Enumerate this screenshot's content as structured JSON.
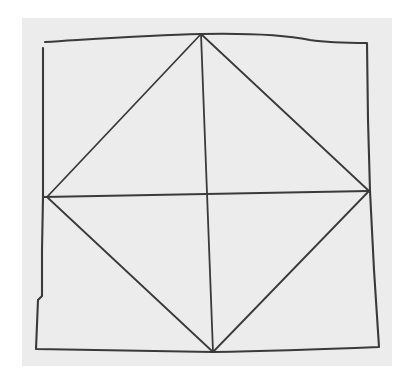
{
  "figure": {
    "colors": {
      "page": "#ffffff",
      "paper": "#ececec",
      "ink": "#3a3a3a"
    },
    "paper_rect": {
      "x": 22,
      "y": 18,
      "w": 370,
      "h": 348
    },
    "outer_square": {
      "path": "M45,42 C110,38 150,35 201,34 C250,33 290,36 310,40 C330,43 350,43 367,43 L368,120 L370,191 L374,270 L379,347 C330,349 280,351 213,352 C150,351 90,350 36,349 L38,300 L42,296 L42,250 L43,197 L43,120 L43,48"
    },
    "diamond": {
      "top": [
        201,
        34
      ],
      "right": [
        369,
        191
      ],
      "bottom": [
        213,
        352
      ],
      "left": [
        47,
        197
      ]
    },
    "midlines": {
      "vertical": {
        "from": [
          201,
          34
        ],
        "to": [
          213,
          352
        ]
      },
      "horizontal": {
        "from": [
          43,
          197
        ],
        "to": [
          369,
          191
        ]
      }
    },
    "stroke_width": 1.8
  }
}
